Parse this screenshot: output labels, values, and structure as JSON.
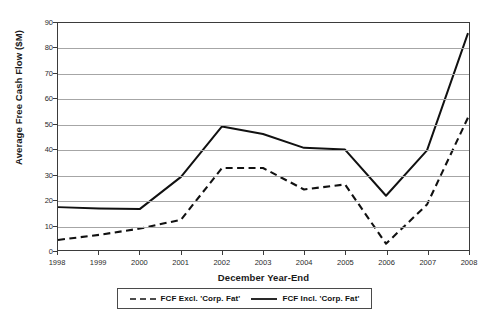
{
  "figure": {
    "top_clipped_caption": "",
    "background_color": "#ffffff"
  },
  "chart_data": {
    "type": "line",
    "title": "",
    "xlabel": "December Year-End",
    "ylabel": "Average Free Cash Flow ($M)",
    "categories": [
      "1998",
      "1999",
      "2000",
      "2001",
      "2002",
      "2003",
      "2004",
      "2005",
      "2006",
      "2007",
      "2008"
    ],
    "x": [
      1998,
      1999,
      2000,
      2001,
      2002,
      2003,
      2004,
      2005,
      2006,
      2007,
      2008
    ],
    "series": [
      {
        "name": "FCF Excl. 'Corp. Fat'",
        "style": "dashed",
        "color": "#111111",
        "values": [
          4.0,
          6.0,
          8.5,
          12.0,
          32.5,
          32.5,
          24.0,
          26.0,
          2.5,
          18.0,
          52.5
        ]
      },
      {
        "name": "FCF Incl. 'Corp. Fat'",
        "style": "solid",
        "color": "#111111",
        "values": [
          17.0,
          16.5,
          16.3,
          29.0,
          49.0,
          46.0,
          40.5,
          39.8,
          21.5,
          39.5,
          86.0
        ]
      }
    ],
    "ylim": [
      0,
      90
    ],
    "yticks": [
      0,
      10,
      20,
      30,
      40,
      50,
      60,
      70,
      80,
      90
    ],
    "ytick_labels": [
      "0",
      "10",
      "20",
      "30",
      "40",
      "50",
      "60",
      "70",
      "80",
      "90"
    ],
    "xlim": [
      1998,
      2008
    ],
    "grid": "horizontal",
    "legend_position": "bottom-center"
  },
  "legend": {
    "entries": [
      {
        "label": "FCF Excl. 'Corp. Fat'",
        "style": "dashed"
      },
      {
        "label": "FCF Incl. 'Corp. Fat'",
        "style": "solid"
      }
    ]
  }
}
